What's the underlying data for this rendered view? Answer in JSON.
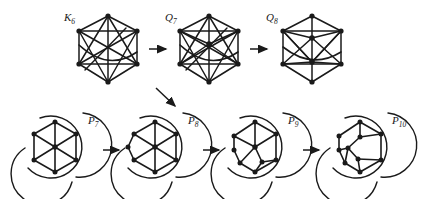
{
  "figure": {
    "type": "graph-transformation-diagram",
    "background_color": "#ffffff",
    "ink_color": "#1a1a1a",
    "top_row": {
      "graphs": [
        {
          "id": "K6",
          "label_base": "K",
          "label_sub": "6",
          "label_full": "K6",
          "description": "complete graph on 6 vertices drawn as hexagon with all diagonals",
          "vertex_count": 6,
          "edge_count": 15
        },
        {
          "id": "Q7",
          "label_base": "Q",
          "label_sub": "7",
          "label_full": "Q7",
          "description": "hexagon with all diagonals plus one central vertex joined to all",
          "vertex_count": 7,
          "edge_count": 21
        },
        {
          "id": "Q8",
          "label_base": "Q",
          "label_sub": "8",
          "label_full": "Q8",
          "description": "hexagonal frame with two interior vertices and crossing chords",
          "vertex_count": 8,
          "edge_count": 24
        }
      ]
    },
    "bottom_row": {
      "graphs": [
        {
          "id": "P7",
          "label_base": "P",
          "label_sub": "7",
          "label_full": "P7",
          "description": "hexagon with centre vertex embedded in a disc with three external arcs",
          "vertex_count": 7
        },
        {
          "id": "P8",
          "label_base": "P",
          "label_sub": "8",
          "label_full": "P8",
          "description": "planar embedding with eight vertices and three external arcs",
          "vertex_count": 8
        },
        {
          "id": "P9",
          "label_base": "P",
          "label_sub": "9",
          "label_full": "P9",
          "description": "planar embedding with nine vertices and three external arcs",
          "vertex_count": 9
        },
        {
          "id": "P10",
          "label_base": "P",
          "label_sub": "10",
          "label_full": "P10",
          "description": "planar embedding with ten vertices and three external arcs",
          "vertex_count": 10
        }
      ]
    },
    "arrows": [
      {
        "name": "arrow-k6-to-q7",
        "direction": "right",
        "from": "K6",
        "to": "Q7"
      },
      {
        "name": "arrow-q7-to-q8",
        "direction": "right",
        "from": "Q7",
        "to": "Q8"
      },
      {
        "name": "arrow-q7-to-p8",
        "direction": "down-right-diagonal",
        "from": "Q7",
        "to": "P8"
      },
      {
        "name": "arrow-p7-to-p8",
        "direction": "right",
        "from": "P7",
        "to": "P8"
      },
      {
        "name": "arrow-p8-to-p9",
        "direction": "right",
        "from": "P8",
        "to": "P9"
      },
      {
        "name": "arrow-p9-to-p10",
        "direction": "right",
        "from": "P9",
        "to": "P10"
      }
    ]
  }
}
